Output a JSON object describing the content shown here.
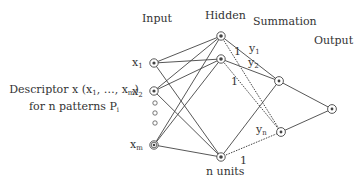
{
  "layers": {
    "input": "Input",
    "hidden": "Hidden",
    "summation": "Summation",
    "output": "Output"
  },
  "descriptor": {
    "line1_prefix": "Descriptor x (x",
    "line1_sub1": "1",
    "line1_mid": ", …, x",
    "line1_sub2": "m",
    "line1_suffix": ")",
    "line2_prefix": "for n patterns P",
    "line2_sub": "i"
  },
  "input_nodes": [
    {
      "base": "x",
      "sub": "1"
    },
    {
      "base": "x",
      "sub": "2"
    },
    {
      "base": "x",
      "sub": "m"
    }
  ],
  "weights": {
    "y1": {
      "base": "y",
      "sub": "1"
    },
    "y2": {
      "base": "y",
      "sub": "2"
    },
    "yn": {
      "base": "y",
      "sub": "n"
    },
    "one_a": "1",
    "one_b": "1",
    "one_c": "1"
  },
  "hidden_caption": "n units",
  "colors": {
    "line": "#444444",
    "node": "#444444",
    "text": "#333333"
  }
}
